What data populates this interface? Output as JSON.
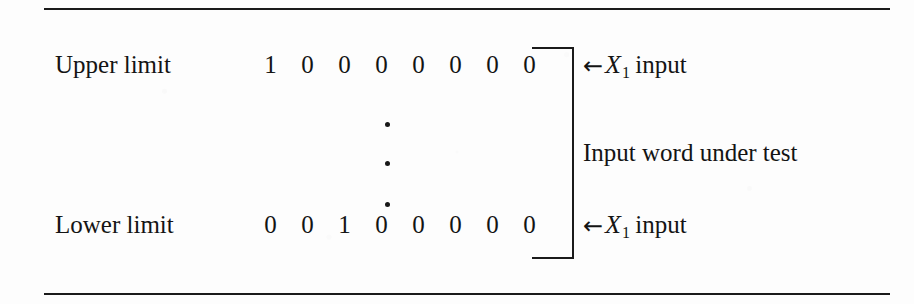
{
  "figure": {
    "background_color": "#fdfdfd",
    "ink_color": "#141414",
    "rules": {
      "top_present": true,
      "bottom_present": true
    }
  },
  "rows": {
    "upper": {
      "label": "Upper limit",
      "bits": [
        "1",
        "0",
        "0",
        "0",
        "0",
        "0",
        "0",
        "0"
      ],
      "annotation_arrow": "←",
      "annotation_variable": "X",
      "annotation_subscript": "1",
      "annotation_suffix": "input"
    },
    "lower": {
      "label": "Lower limit",
      "bits": [
        "0",
        "0",
        "1",
        "0",
        "0",
        "0",
        "0",
        "0"
      ],
      "annotation_arrow": "←",
      "annotation_variable": "X",
      "annotation_subscript": "1",
      "annotation_suffix": "input"
    }
  },
  "ellipsis": {
    "glyph": "·",
    "count": 3,
    "orientation": "vertical"
  },
  "bracket": {
    "shape": "right-square-bracket",
    "label": "Input word under test"
  }
}
